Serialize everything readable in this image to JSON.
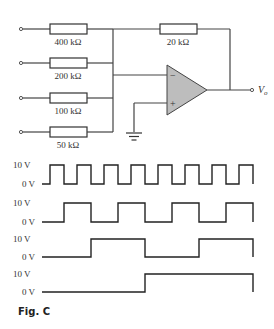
{
  "figure": {
    "caption": "Fig. C",
    "circuit": {
      "type": "summing amplifier (4-bit DAC)",
      "input_resistors": [
        {
          "label": "400 kΩ",
          "y": 29
        },
        {
          "label": "200 kΩ",
          "y": 63
        },
        {
          "label": "100 kΩ",
          "y": 98
        },
        {
          "label": "50 kΩ",
          "y": 132
        }
      ],
      "feedback_resistor": {
        "label": "20 kΩ"
      },
      "opamp": {
        "minus": "−",
        "plus": "+",
        "fill": "#bdbdbd"
      },
      "output_label": "V",
      "output_sub": "o"
    },
    "waveforms": [
      {
        "high_label": "10 V",
        "low_label": "0 V",
        "y_high": 165,
        "y_low": 184,
        "points": "42,184 50,184 50,165 64,165 64,184 77,184 77,165 91,165 91,184 104,184 104,165 118,165 118,184 131,184 131,165 145,165 145,184 158,184 158,165 172,165 172,184 185,184 185,165 199,165 199,184 212,184 212,165 226,165 226,184 239,184 239,165 253,165 253,184"
      },
      {
        "high_label": "10 V",
        "low_label": "0 V",
        "y_high": 203,
        "y_low": 222,
        "points": "42,222 64,222 64,203 91,203 91,222 118,222 118,203 145,203 145,222 172,222 172,203 199,203 199,222 226,222 226,203 253,203 253,222"
      },
      {
        "high_label": "10 V",
        "low_label": "0 V",
        "y_high": 239,
        "y_low": 257,
        "points": "42,257 91,257 91,239 145,239 145,257 199,257 199,239 253,239 253,257"
      },
      {
        "high_label": "10 V",
        "low_label": "0 V",
        "y_high": 274,
        "y_low": 292,
        "points": "42,292 145,292 145,274 253,274 253,292"
      }
    ]
  }
}
